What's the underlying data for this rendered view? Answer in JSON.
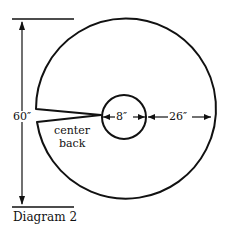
{
  "diagram": {
    "caption": "Diagram 2",
    "labels": {
      "total_height": "60″",
      "center_opening": "8″",
      "radius_width": "26″",
      "center_back_line1": "center",
      "center_back_line2": "back"
    },
    "colors": {
      "stroke": "#111111",
      "background": "#ffffff"
    }
  }
}
